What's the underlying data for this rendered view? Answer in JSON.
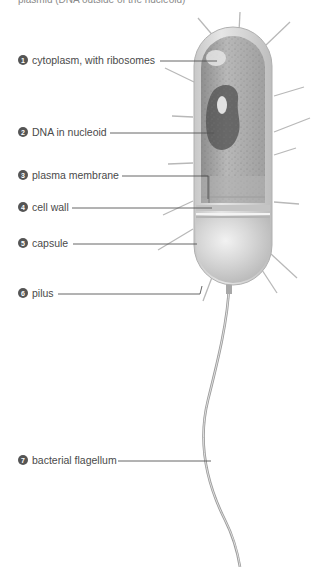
{
  "caption_top": "plasmid (DNA outside of the nucleoid)",
  "colors": {
    "label_text": "#4a4a4a",
    "number_badge": "#555555",
    "leader_line": "#555555",
    "cell_outer": "#d8d8d8",
    "cytoplasm": "#a9a9a9",
    "pili": "#b5b5b5"
  },
  "labels": [
    {
      "num": "1",
      "text": "cytoplasm, with ribosomes"
    },
    {
      "num": "2",
      "text": "DNA in nucleoid"
    },
    {
      "num": "3",
      "text": "plasma membrane"
    },
    {
      "num": "4",
      "text": "cell wall"
    },
    {
      "num": "5",
      "text": "capsule"
    },
    {
      "num": "6",
      "text": "pilus"
    },
    {
      "num": "7",
      "text": "bacterial flagellum"
    }
  ]
}
